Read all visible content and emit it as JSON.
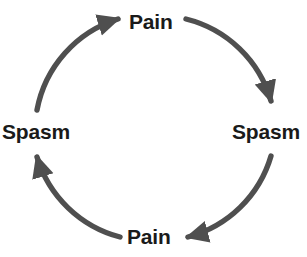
{
  "diagram": {
    "type": "cycle",
    "direction": "clockwise",
    "stroke_color": "#4f4f4f",
    "text_color": "#1a1a1a",
    "background_color": "#ffffff",
    "nodes": [
      {
        "id": "top",
        "label": "Pain",
        "position": "top"
      },
      {
        "id": "right",
        "label": "Spasm",
        "position": "right"
      },
      {
        "id": "bottom",
        "label": "Pain",
        "position": "bottom"
      },
      {
        "id": "left",
        "label": "Spasm",
        "position": "left"
      }
    ],
    "edges": [
      {
        "id": "top-to-right",
        "from": "top",
        "to": "right",
        "arrow": "down"
      },
      {
        "id": "right-to-bottom",
        "from": "right",
        "to": "bottom",
        "arrow": "left"
      },
      {
        "id": "bottom-to-left",
        "from": "bottom",
        "to": "left",
        "arrow": "up"
      },
      {
        "id": "left-to-top",
        "from": "left",
        "to": "top",
        "arrow": "right"
      }
    ]
  }
}
